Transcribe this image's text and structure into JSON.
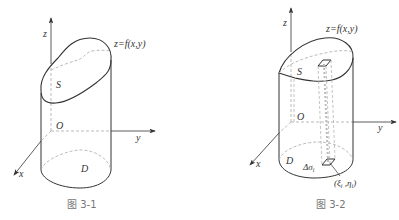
{
  "figures": [
    {
      "id": "fig1",
      "caption": "图 3-1",
      "labels": {
        "z_axis": "z",
        "y_axis": "y",
        "x_axis": "x",
        "origin": "O",
        "surface": "S",
        "region": "D",
        "equation": "z=f(x,y)"
      }
    },
    {
      "id": "fig2",
      "caption": "图 3-2",
      "labels": {
        "z_axis": "z",
        "y_axis": "y",
        "x_axis": "x",
        "origin": "O",
        "surface": "S",
        "region": "D",
        "equation": "z=f(x,y)",
        "area_element": "Δσ",
        "area_element_sub": "i",
        "point": "(ξ",
        "point_sub1": "i",
        "point_mid": " ,η",
        "point_sub2": "i",
        "point_close": ")"
      }
    }
  ],
  "colors": {
    "stroke": "#333333",
    "dashed": "#aaaaaa",
    "caption": "#777777"
  }
}
